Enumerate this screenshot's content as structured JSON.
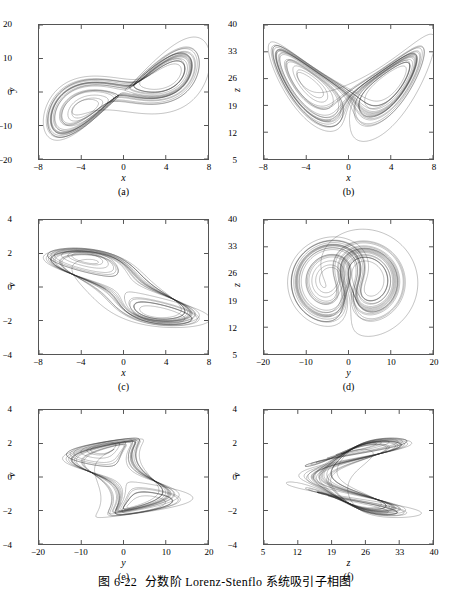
{
  "figure": {
    "caption_number": "图 6-22",
    "caption_text": "分数阶 Lorenz-Stenflo 系统吸引子相图",
    "stroke_color": "#2b2b2b",
    "frame_color": "#555555",
    "background": "#ffffff"
  },
  "chart_data": [
    {
      "id": "a",
      "type": "line",
      "title": "",
      "panel_label": "(a)",
      "xlabel": "x",
      "ylabel": "y",
      "xlim": [
        -8,
        8
      ],
      "ylim": [
        -20,
        20
      ],
      "xticks": [
        -8,
        -4,
        0,
        4,
        8
      ],
      "yticks": [
        -20,
        -10,
        0,
        10,
        20
      ],
      "xtick_labels": [
        "-8",
        "-4",
        "0",
        "4",
        "8"
      ],
      "ytick_labels": [
        "-20",
        "-10",
        "0",
        "10",
        "20"
      ],
      "grid": false,
      "legend": "none",
      "shape": "tilted figure-eight butterfly, two lobes with teardrop holes",
      "projection": "xy"
    },
    {
      "id": "b",
      "type": "line",
      "title": "",
      "panel_label": "(b)",
      "xlabel": "x",
      "ylabel": "z",
      "xlim": [
        -8,
        8
      ],
      "ylim": [
        5,
        40
      ],
      "xticks": [
        -8,
        -4,
        0,
        4,
        8
      ],
      "yticks": [
        5,
        12,
        19,
        26,
        33,
        40
      ],
      "xtick_labels": [
        "-8",
        "-4",
        "0",
        "4",
        "8"
      ],
      "ytick_labels": [
        "5",
        "12",
        "19",
        "26",
        "33",
        "40"
      ],
      "grid": false,
      "legend": "none",
      "shape": "symmetric V-shaped wings with two triangular holes",
      "projection": "xz"
    },
    {
      "id": "c",
      "type": "line",
      "title": "",
      "panel_label": "(c)",
      "xlabel": "x",
      "ylabel": "v",
      "xlim": [
        -8,
        8
      ],
      "ylim": [
        -4,
        4
      ],
      "xticks": [
        -8,
        -4,
        0,
        4,
        8
      ],
      "yticks": [
        -4,
        -2,
        0,
        2,
        4
      ],
      "xtick_labels": [
        "-8",
        "-4",
        "0",
        "4",
        "8"
      ],
      "ytick_labels": [
        "-4",
        "-2",
        "0",
        "2",
        "4"
      ],
      "grid": false,
      "legend": "none",
      "shape": "diagonal lens band with two elliptical holes",
      "projection": "xv"
    },
    {
      "id": "d",
      "type": "line",
      "title": "",
      "panel_label": "(d)",
      "xlabel": "y",
      "ylabel": "z",
      "xlim": [
        -20,
        20
      ],
      "ylim": [
        5,
        40
      ],
      "xticks": [
        -20,
        -10,
        0,
        10,
        20
      ],
      "yticks": [
        5,
        12,
        19,
        26,
        33,
        40
      ],
      "xtick_labels": [
        "-20",
        "-10",
        "0",
        "10",
        "20"
      ],
      "ytick_labels": [
        "5",
        "12",
        "19",
        "26",
        "33",
        "40"
      ],
      "grid": false,
      "legend": "none",
      "shape": "rounded double lobe with two comma-shaped holes",
      "projection": "yz"
    },
    {
      "id": "e",
      "type": "line",
      "title": "",
      "panel_label": "(e)",
      "xlabel": "y",
      "ylabel": "v",
      "xlim": [
        -20,
        20
      ],
      "ylim": [
        -4,
        4
      ],
      "xticks": [
        -20,
        -10,
        0,
        10,
        20
      ],
      "yticks": [
        -4,
        -2,
        0,
        2,
        4
      ],
      "xtick_labels": [
        "-20",
        "-10",
        "0",
        "10",
        "20"
      ],
      "ytick_labels": [
        "-4",
        "-2",
        "0",
        "2",
        "4"
      ],
      "grid": false,
      "legend": "none",
      "shape": "hourglass bowtie with bright diamond core",
      "projection": "yv"
    },
    {
      "id": "f",
      "type": "line",
      "title": "",
      "panel_label": "(f)",
      "xlabel": "z",
      "ylabel": "v",
      "xlim": [
        5,
        40
      ],
      "ylim": [
        -4,
        4
      ],
      "xticks": [
        5,
        12,
        19,
        26,
        33,
        40
      ],
      "yticks": [
        -4,
        -2,
        0,
        2,
        4
      ],
      "xtick_labels": [
        "5",
        "12",
        "19",
        "26",
        "33",
        "40"
      ],
      "ytick_labels": [
        "-4",
        "-2",
        "0",
        "2",
        "4"
      ],
      "grid": false,
      "legend": "none",
      "shape": "sideways wedge opening right with two elongated holes",
      "projection": "zv"
    }
  ]
}
